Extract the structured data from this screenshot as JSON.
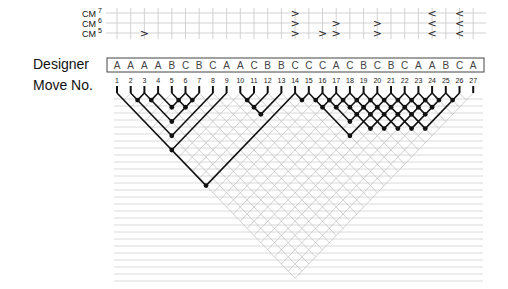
{
  "labels": {
    "cm7": "CM",
    "cm7_sup": "7",
    "cm6": "CM",
    "cm6_sup": "6",
    "cm5": "CM",
    "cm5_sup": "5",
    "designer": "Designer",
    "move_no": "Move No."
  },
  "moves": [
    {
      "n": "1",
      "designer": "A"
    },
    {
      "n": "2",
      "designer": "A"
    },
    {
      "n": "3",
      "designer": "A"
    },
    {
      "n": "4",
      "designer": "A"
    },
    {
      "n": "5",
      "designer": "B"
    },
    {
      "n": "6",
      "designer": "C"
    },
    {
      "n": "7",
      "designer": "B"
    },
    {
      "n": "8",
      "designer": "C"
    },
    {
      "n": "9",
      "designer": "A"
    },
    {
      "n": "10",
      "designer": "A"
    },
    {
      "n": "11",
      "designer": "C"
    },
    {
      "n": "12",
      "designer": "B"
    },
    {
      "n": "13",
      "designer": "B"
    },
    {
      "n": "14",
      "designer": "C"
    },
    {
      "n": "15",
      "designer": "C"
    },
    {
      "n": "16",
      "designer": "C"
    },
    {
      "n": "17",
      "designer": "A"
    },
    {
      "n": "18",
      "designer": "C"
    },
    {
      "n": "19",
      "designer": "B"
    },
    {
      "n": "20",
      "designer": "C"
    },
    {
      "n": "21",
      "designer": "B"
    },
    {
      "n": "22",
      "designer": "C"
    },
    {
      "n": "23",
      "designer": "A"
    },
    {
      "n": "24",
      "designer": "A"
    },
    {
      "n": "25",
      "designer": "B"
    },
    {
      "n": "26",
      "designer": "C"
    },
    {
      "n": "27",
      "designer": "A"
    }
  ],
  "cm_markers": [
    {
      "move": 3,
      "level": 5,
      "symbol": ">"
    },
    {
      "move": 14,
      "level": 7,
      "symbol": ">"
    },
    {
      "move": 14,
      "level": 6,
      "symbol": ">"
    },
    {
      "move": 14,
      "level": 5,
      "symbol": ">"
    },
    {
      "move": 16,
      "level": 5,
      "symbol": ">"
    },
    {
      "move": 17,
      "level": 6,
      "symbol": ">"
    },
    {
      "move": 17,
      "level": 5,
      "symbol": ">"
    },
    {
      "move": 20,
      "level": 6,
      "symbol": ">"
    },
    {
      "move": 20,
      "level": 5,
      "symbol": ">"
    },
    {
      "move": 24,
      "level": 7,
      "symbol": "<"
    },
    {
      "move": 24,
      "level": 6,
      "symbol": "<"
    },
    {
      "move": 24,
      "level": 5,
      "symbol": "<"
    },
    {
      "move": 26,
      "level": 7,
      "symbol": "<"
    },
    {
      "move": 26,
      "level": 6,
      "symbol": "<"
    },
    {
      "move": 26,
      "level": 5,
      "symbol": "<"
    }
  ],
  "links": [
    [
      2,
      3
    ],
    [
      3,
      4
    ],
    [
      5,
      6
    ],
    [
      6,
      7
    ],
    [
      5,
      7
    ],
    [
      4,
      6
    ],
    [
      3,
      7
    ],
    [
      2,
      8
    ],
    [
      1,
      9
    ],
    [
      10,
      11
    ],
    [
      10,
      12
    ],
    [
      10,
      13
    ],
    [
      1,
      14
    ],
    [
      14,
      15
    ],
    [
      15,
      16
    ],
    [
      15,
      17
    ],
    [
      16,
      17
    ],
    [
      16,
      18
    ],
    [
      17,
      18
    ],
    [
      17,
      19
    ],
    [
      16,
      20
    ],
    [
      15,
      21
    ],
    [
      18,
      19
    ],
    [
      19,
      20
    ],
    [
      18,
      20
    ],
    [
      20,
      21
    ],
    [
      19,
      21
    ],
    [
      21,
      22
    ],
    [
      20,
      22
    ],
    [
      22,
      23
    ],
    [
      21,
      23
    ],
    [
      23,
      24
    ],
    [
      22,
      24
    ],
    [
      24,
      25
    ],
    [
      23,
      25
    ],
    [
      25,
      26
    ],
    [
      20,
      23
    ],
    [
      19,
      22
    ],
    [
      18,
      21
    ],
    [
      17,
      20
    ],
    [
      21,
      24
    ],
    [
      20,
      25
    ],
    [
      19,
      24
    ],
    [
      18,
      23
    ],
    [
      17,
      22
    ],
    [
      22,
      25
    ],
    [
      21,
      26
    ]
  ],
  "colors": {
    "line": "#111111",
    "grid": "#bdbdbd",
    "cm_grid": "#c8c8c8",
    "rule": "#d0d0d0"
  }
}
